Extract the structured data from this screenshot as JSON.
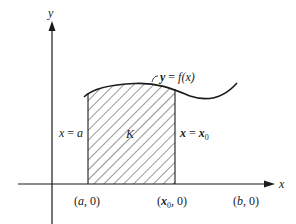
{
  "diagram": {
    "axes": {
      "x_label": "x",
      "y_label": "y"
    },
    "curve": {
      "label_y": "y",
      "label_eq": " = ",
      "label_f": "f",
      "label_x": "(x)"
    },
    "region": {
      "label": "K",
      "left_line": {
        "lhs": "x",
        "eq": " = ",
        "rhs": "a"
      },
      "right_line": {
        "lhs": "x",
        "eq": " = ",
        "rhs": "x",
        "sub": "0"
      }
    },
    "points": {
      "a": {
        "open": "(",
        "var": "a",
        "rest": ", 0)"
      },
      "x0": {
        "open": "(",
        "var": "x",
        "sub": "0",
        "rest": ", 0)"
      },
      "b": {
        "open": "(",
        "var": "b",
        "rest": ", 0)"
      }
    },
    "colors": {
      "ink": "#1a1a1a",
      "background": "#ffffff"
    }
  }
}
